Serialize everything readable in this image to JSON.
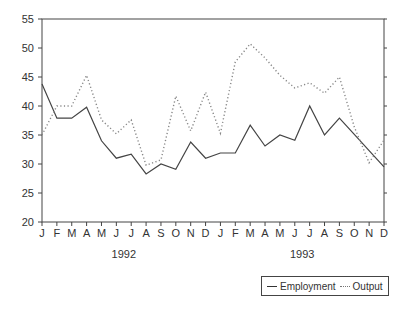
{
  "chart_data": {
    "type": "line",
    "title": "",
    "xlabel": "",
    "ylabel": "",
    "ylim": [
      20,
      55
    ],
    "yticks": [
      20,
      25,
      30,
      35,
      40,
      45,
      50,
      55
    ],
    "x": [
      "J",
      "F",
      "M",
      "A",
      "M",
      "J",
      "J",
      "A",
      "S",
      "O",
      "N",
      "D",
      "J",
      "F",
      "M",
      "A",
      "M",
      "J",
      "J",
      "A",
      "S",
      "O",
      "N",
      "D"
    ],
    "year_labels": [
      {
        "label": "1992",
        "center_index": 5.5
      },
      {
        "label": "1993",
        "center_index": 17.5
      }
    ],
    "grid": false,
    "legend_position": "bottom-right",
    "series": [
      {
        "name": "Employment",
        "style": "solid",
        "values": [
          43.8,
          37.9,
          37.9,
          39.8,
          34.0,
          31.0,
          31.7,
          28.3,
          30.0,
          29.1,
          33.8,
          31.0,
          31.9,
          31.9,
          36.7,
          33.1,
          35.0,
          34.1,
          40.0,
          35.0,
          37.9,
          35.1,
          32.3,
          29.5
        ]
      },
      {
        "name": "Output",
        "style": "dotted",
        "values": [
          35.0,
          40.0,
          40.0,
          45.3,
          37.6,
          35.2,
          37.6,
          29.8,
          30.7,
          41.7,
          35.7,
          42.4,
          35.3,
          47.6,
          50.7,
          48.3,
          45.3,
          43.1,
          44.0,
          42.2,
          45.0,
          36.4,
          30.2,
          34.1
        ]
      }
    ]
  },
  "legend": {
    "items": [
      {
        "label": "Employment"
      },
      {
        "label": "Output"
      }
    ]
  }
}
